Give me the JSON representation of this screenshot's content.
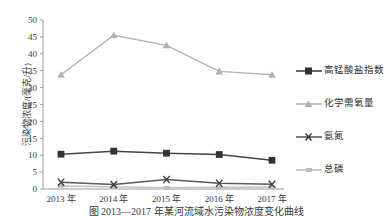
{
  "chart_data": {
    "type": "line",
    "title": "",
    "xlabel": "",
    "ylabel": "污染物浓度/(毫克/升)",
    "categories": [
      "2013 年",
      "2014 年",
      "2015 年",
      "2016 年",
      "2017 年"
    ],
    "ylim": [
      0,
      50
    ],
    "ytick_step": 5,
    "yticks": [
      "0",
      "5",
      "10",
      "15",
      "20",
      "25",
      "30",
      "35",
      "40",
      "45",
      "50"
    ],
    "grid": false,
    "legend_position": "right",
    "series": [
      {
        "name": "高锰酸盐指数",
        "values": [
          10.3,
          11.2,
          10.6,
          10.2,
          8.5
        ],
        "color": "#454545",
        "marker": "square"
      },
      {
        "name": "化学需氧量",
        "values": [
          33.8,
          45.5,
          42.5,
          34.8,
          33.8
        ],
        "color": "#b4b4b4",
        "marker": "triangle"
      },
      {
        "name": "氨氮",
        "values": [
          2.0,
          1.3,
          2.8,
          1.7,
          1.4
        ],
        "color": "#5a5a5a",
        "marker": "x"
      },
      {
        "name": "总磷",
        "values": [
          0.9,
          0.7,
          0.4,
          0.5,
          0.6
        ],
        "color": "#c2c2c2",
        "marker": "dash"
      }
    ]
  },
  "caption": {
    "text": "图 2013—2017 年某河流域水污染物浓度变化曲线"
  }
}
